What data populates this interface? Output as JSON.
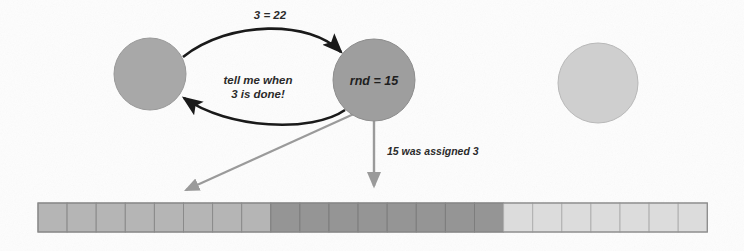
{
  "figure": {
    "title": "",
    "background_color": "#fdfdfd"
  },
  "nodes": [
    {
      "id": "left-peer",
      "label": "",
      "cx": 150,
      "cy": 74,
      "r": 36,
      "fill": "#a8a8a8",
      "stroke": "#999999"
    },
    {
      "id": "rnd-node",
      "label": "rnd = 15",
      "cx": 374,
      "cy": 80,
      "r": 41,
      "fill": "#9e9e9e",
      "stroke": "#8d8d8d"
    },
    {
      "id": "idle-peer",
      "label": "",
      "cx": 598,
      "cy": 83,
      "r": 40,
      "fill": "#cfcfcf",
      "stroke": "#b8b8b8"
    }
  ],
  "edges": [
    {
      "id": "request-edge",
      "label": "3 = 22",
      "label_x": 270,
      "label_y": 17,
      "color": "#1a1a1a"
    },
    {
      "id": "callback-edge",
      "label": "tell me when\n3 is done!",
      "label_line1": "tell me when",
      "label_line2": "3 is done!",
      "label_x": 258,
      "label_y": 86,
      "color": "#1a1a1a"
    },
    {
      "id": "assignment-edge",
      "label": "15 was assigned 3",
      "label_x": 387,
      "label_y": 152,
      "color": "#9a9a9a"
    },
    {
      "id": "claim-edge",
      "label": "",
      "color": "#9a9a9a"
    }
  ],
  "chart_data": {
    "type": "bar",
    "title": "",
    "xlabel": "",
    "ylabel": "",
    "cells_total": 23,
    "cell_width": 29.1,
    "bar_x": 38,
    "bar_y": 203,
    "bar_height": 29,
    "segments": [
      {
        "name": "unclaimed-left",
        "count": 8,
        "color": "#b5b5b5",
        "stroke": "#8a8a8a"
      },
      {
        "name": "claimed-block",
        "count": 8,
        "color": "#959595",
        "stroke": "#7d7d7d"
      },
      {
        "name": "unclaimed-right",
        "count": 7,
        "color": "#dcdcdc",
        "stroke": "#b0b0b0"
      }
    ],
    "legend_position": "none",
    "grid": false
  },
  "pointers": [
    {
      "id": "claim-pointer",
      "name": "claim-arrowhead",
      "x": 182,
      "y": 196,
      "color": "#9a9a9a"
    },
    {
      "id": "assignment-pointer",
      "name": "assignment-arrowhead",
      "x": 374,
      "y": 196,
      "color": "#9a9a9a"
    }
  ]
}
